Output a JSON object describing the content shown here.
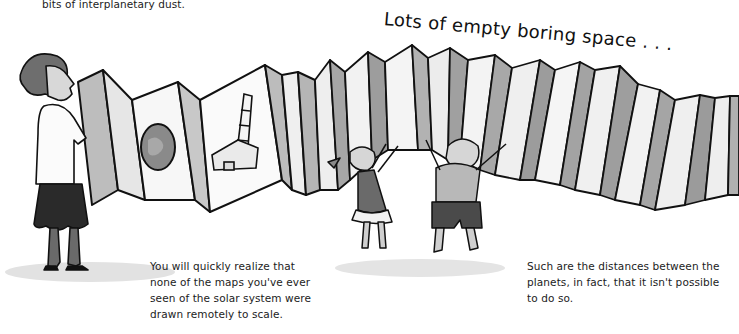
{
  "page": {
    "top_fragment": "bits of interplanetary dust.",
    "headline": "Lots of empty boring space . . .",
    "captions": [
      {
        "lines": [
          "You will quickly realize that",
          "none of the maps you've ever",
          "seen of the solar system were",
          "drawn remotely to scale."
        ]
      },
      {
        "lines": [
          "Such are the distances between the",
          "planets, in fact, that it isn't possible",
          "to do so."
        ]
      }
    ]
  },
  "illustration": {
    "description": "Woman unfolding a very long accordion-folded map showing a planet and a space shuttle; two children jump up to hold the far end",
    "panels": [
      {
        "content": "planet"
      },
      {
        "content": "space-shuttle"
      },
      {
        "content": "empty"
      }
    ],
    "colors": {
      "ink": "#111111",
      "wash_light": "#c9c9c9",
      "wash_mid": "#9a9a9a",
      "wash_dark": "#555555",
      "skirt": "#2a2a2a",
      "shadow": "#dcdcdc"
    }
  }
}
